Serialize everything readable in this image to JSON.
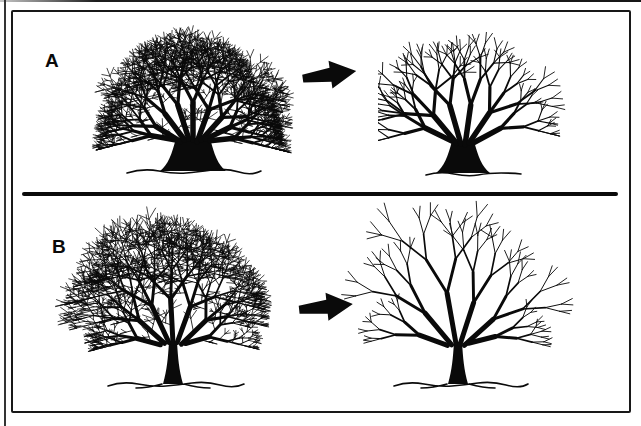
{
  "diagram": {
    "panels": [
      {
        "label": "A"
      },
      {
        "label": "B"
      }
    ],
    "colors": {
      "ink": "#0a0a0a",
      "paper": "#ffffff"
    },
    "icons": {
      "arrow_right": "➡"
    }
  }
}
